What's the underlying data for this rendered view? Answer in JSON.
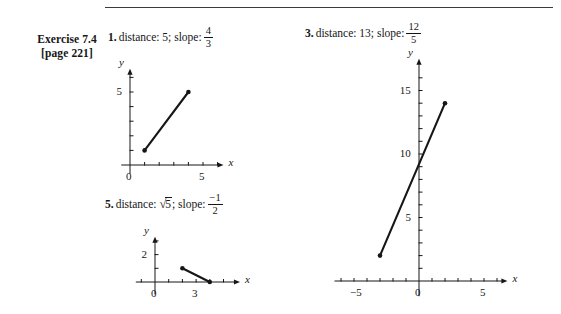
{
  "header": {
    "exercise_title": "Exercise 7.4",
    "page_ref": "[page 221]"
  },
  "problems": [
    {
      "number": "1.",
      "text": "distance: 5; slope:",
      "fraction": {
        "numerator": "4",
        "denominator": "3"
      }
    },
    {
      "number": "3.",
      "text": "distance: 13; slope:",
      "fraction": {
        "numerator": "12",
        "denominator": "5"
      }
    },
    {
      "number": "5.",
      "text_before": "distance:",
      "radicand": "5",
      "text_after": "; slope:",
      "fraction": {
        "numerator": "−1",
        "denominator": "2"
      }
    }
  ],
  "chart_data": [
    {
      "id": "graph-1",
      "type": "line",
      "title": "1. distance: 5; slope: 4/3",
      "xlabel": "x",
      "ylabel": "y",
      "xlim": [
        -0.6,
        6.4
      ],
      "ylim": [
        -0.6,
        6.6
      ],
      "xticks": [
        1,
        2,
        3,
        4,
        5,
        6
      ],
      "yticks": [
        1,
        2,
        3,
        4,
        5,
        6
      ],
      "xticklabels": [
        {
          "value": 0,
          "label": "0"
        },
        {
          "value": 5,
          "label": "5"
        }
      ],
      "yticklabels": [
        {
          "value": 5,
          "label": "5"
        }
      ],
      "grid": false,
      "series": [
        {
          "name": "segment",
          "points": [
            {
              "x": 1,
              "y": 1
            },
            {
              "x": 4,
              "y": 5
            }
          ],
          "endpoint_markers": true
        }
      ]
    },
    {
      "id": "graph-3",
      "type": "line",
      "title": "3. distance: 13; slope: 12/5",
      "xlabel": "x",
      "ylabel": "y",
      "xlim": [
        -6.5,
        6.8
      ],
      "ylim": [
        -1.2,
        17.5
      ],
      "xticks": [
        -6,
        -5,
        -4,
        -3,
        -2,
        -1,
        1,
        2,
        3,
        4,
        5,
        6
      ],
      "yticks": [
        1,
        2,
        3,
        4,
        5,
        6,
        7,
        8,
        9,
        10,
        11,
        12,
        13,
        14,
        15,
        16
      ],
      "xticklabels": [
        {
          "value": -5,
          "label": "−5"
        },
        {
          "value": 0,
          "label": "0"
        },
        {
          "value": 5,
          "label": "5"
        }
      ],
      "yticklabels": [
        {
          "value": 5,
          "label": "5"
        },
        {
          "value": 10,
          "label": "10"
        },
        {
          "value": 15,
          "label": "15"
        }
      ],
      "grid": false,
      "series": [
        {
          "name": "segment",
          "points": [
            {
              "x": -3,
              "y": 2
            },
            {
              "x": 2,
              "y": 14
            }
          ],
          "endpoint_markers": true
        }
      ]
    },
    {
      "id": "graph-5",
      "type": "line",
      "title": "5. distance: √5; slope: -1/2",
      "xlabel": "x",
      "ylabel": "y",
      "xlim": [
        -1.4,
        6.2
      ],
      "ylim": [
        -0.9,
        3.3
      ],
      "xticks": [
        -1,
        1,
        2,
        3,
        4,
        5
      ],
      "yticks": [
        1,
        2,
        3
      ],
      "xticklabels": [
        {
          "value": 0,
          "label": "0"
        },
        {
          "value": 3,
          "label": "3"
        }
      ],
      "yticklabels": [
        {
          "value": 2,
          "label": "2"
        }
      ],
      "grid": false,
      "series": [
        {
          "name": "segment",
          "points": [
            {
              "x": 2,
              "y": 1
            },
            {
              "x": 4,
              "y": 0
            }
          ],
          "endpoint_markers": true
        }
      ]
    }
  ]
}
